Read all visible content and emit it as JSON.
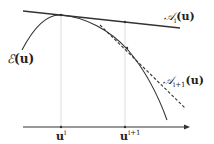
{
  "diagram": {
    "curve_label": {
      "main": "ℰ",
      "arg": "(u)"
    },
    "tangent_i_label": {
      "main": "𝒜",
      "sub": "i",
      "arg": "(u)"
    },
    "tangent_i1_label": {
      "main": "𝒜",
      "sub": "i+1",
      "arg": "(u)"
    },
    "ticks": [
      {
        "base": "u",
        "sup": "i"
      },
      {
        "base": "u",
        "sup": "i+1"
      }
    ],
    "colors": {
      "line": "#333333",
      "guide": "#c8c8c8"
    }
  }
}
